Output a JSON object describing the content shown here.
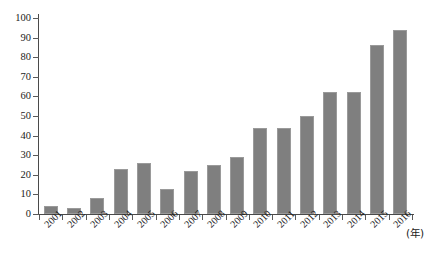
{
  "chart_data": {
    "type": "bar",
    "title": "",
    "xlabel": "(年)",
    "ylabel": "",
    "categories": [
      "2001",
      "2002",
      "2003",
      "2004",
      "2005",
      "2006",
      "2007",
      "2008",
      "2009",
      "2010",
      "2011",
      "2012",
      "2013",
      "2014",
      "2015",
      "2016"
    ],
    "values": [
      4,
      3,
      8,
      23,
      26,
      13,
      22,
      25,
      29,
      44,
      44,
      50,
      62,
      62,
      86,
      94
    ],
    "ylim": [
      0,
      100
    ],
    "yticks": [
      0,
      10,
      20,
      30,
      40,
      50,
      60,
      70,
      80,
      90,
      100
    ],
    "ytick_labels": [
      "0",
      "10",
      "20",
      "30",
      "40",
      "50",
      "60",
      "70",
      "80",
      "90",
      "100"
    ],
    "grid": false,
    "legend": null,
    "bar_color": "#7f7f7f",
    "bar_edge_color": "#9a9a9a",
    "axis_color": "#4a4a4a"
  },
  "axis": {
    "unit_label": "(年)"
  }
}
